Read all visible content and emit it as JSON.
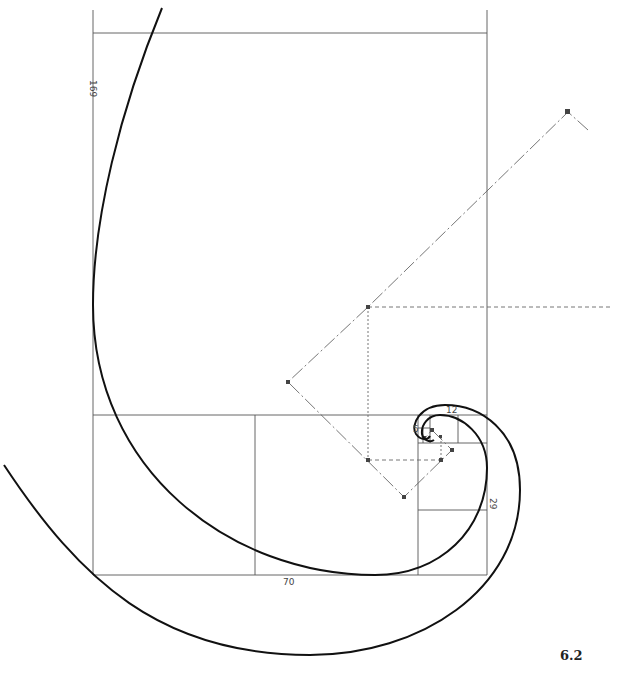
{
  "figure": {
    "number": "6.2"
  },
  "dimensions": {
    "left_height": "169",
    "bottom_width": "70",
    "right_small": "29",
    "top_small": "12",
    "tiny": "5"
  },
  "colors": {
    "background": "#ffffff",
    "ink": "#111111",
    "construction": "#666666"
  }
}
